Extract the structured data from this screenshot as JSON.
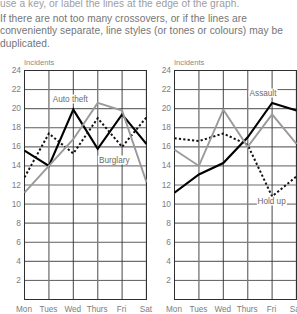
{
  "intro": {
    "lines": [
      "use a key, or label the lines at the edge of the graph.",
      "If there are not too many crossovers, or if the lines are",
      "conveniently separate, line styles (or tones or colours) may be",
      "duplicated."
    ]
  },
  "charts": [
    {
      "id": "left",
      "y_axis_title": "Incidents",
      "y_ticks": [
        "24",
        "22",
        "20",
        "18",
        "16",
        "14",
        "12",
        "10",
        "8",
        "6",
        "4",
        "2"
      ],
      "x_ticks": [
        "Mon",
        "Tues",
        "Wed",
        "Thurs",
        "Fri",
        "Sat"
      ],
      "annotations": [
        {
          "text": "Auto theft",
          "x_frac": 0.38,
          "y_value": 21.0
        },
        {
          "text": "Burglary",
          "x_frac": 0.74,
          "y_value": 14.6
        }
      ],
      "chart_data": {
        "type": "line",
        "title": "",
        "xlabel": "",
        "ylabel": "Incidents",
        "ylim": [
          0,
          24
        ],
        "grid": true,
        "legend": "inline-labels",
        "categories": [
          "Mon",
          "Tues",
          "Wed",
          "Thurs",
          "Fri",
          "Sat"
        ],
        "series": [
          {
            "name": "Auto theft",
            "style": "solid-black",
            "color": "#000000",
            "values": [
              15.6,
              14.0,
              19.9,
              15.8,
              19.4,
              16.3
            ]
          },
          {
            "name": "Burglary",
            "style": "dotted-black",
            "color": "#111111",
            "values": [
              12.8,
              17.4,
              15.3,
              19.0,
              16.0,
              19.1
            ]
          },
          {
            "name": "unlabelled",
            "style": "solid-gray",
            "color": "#9a9a9a",
            "values": [
              11.2,
              14.0,
              16.8,
              20.6,
              19.8,
              12.3
            ]
          }
        ]
      }
    },
    {
      "id": "right",
      "y_axis_title": "Incidents",
      "y_ticks": [
        "24",
        "22",
        "20",
        "18",
        "16",
        "14",
        "12",
        "10",
        "8",
        "6",
        "4",
        "2"
      ],
      "x_ticks": [
        "Mon",
        "Tues",
        "Wed",
        "Thurs",
        "Fri",
        "Sat"
      ],
      "annotations": [
        {
          "text": "Assault",
          "x_frac": 0.73,
          "y_value": 21.6
        },
        {
          "text": "Hold up",
          "x_frac": 0.8,
          "y_value": 10.3
        }
      ],
      "chart_data": {
        "type": "line",
        "title": "",
        "xlabel": "",
        "ylabel": "Incidents",
        "ylim": [
          0,
          24
        ],
        "grid": true,
        "legend": "inline-labels",
        "categories": [
          "Mon",
          "Tues",
          "Wed",
          "Thurs",
          "Fri",
          "Sat"
        ],
        "series": [
          {
            "name": "Assault",
            "style": "solid-black",
            "color": "#000000",
            "values": [
              11.2,
              13.1,
              14.3,
              17.0,
              20.6,
              19.8
            ]
          },
          {
            "name": "Hold up",
            "style": "dotted-black",
            "color": "#111111",
            "values": [
              16.9,
              16.6,
              17.4,
              16.2,
              10.8,
              12.9
            ]
          },
          {
            "name": "unlabelled",
            "style": "solid-gray",
            "color": "#9a9a9a",
            "values": [
              15.7,
              14.0,
              19.9,
              16.0,
              19.4,
              16.3
            ]
          }
        ]
      }
    }
  ]
}
